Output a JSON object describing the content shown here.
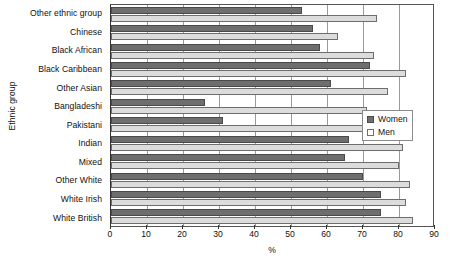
{
  "chart_data": {
    "type": "bar",
    "orientation": "horizontal",
    "title": "",
    "xlabel": "%",
    "ylabel": "Ethnic group",
    "xlim": [
      0,
      90
    ],
    "xticks": [
      0,
      10,
      20,
      30,
      40,
      50,
      60,
      70,
      80,
      90
    ],
    "grid": true,
    "legend_position": "right",
    "categories": [
      "Other ethnic group",
      "Chinese",
      "Black African",
      "Black Caribbean",
      "Other Asian",
      "Bangladeshi",
      "Pakistani",
      "Indian",
      "Mixed",
      "Other White",
      "White Irish",
      "White British"
    ],
    "series": [
      {
        "name": "Women",
        "color": "#6e6e6e",
        "values": [
          53,
          56,
          58,
          72,
          61,
          26,
          31,
          66,
          65,
          70,
          75,
          75
        ]
      },
      {
        "name": "Men",
        "color": "#dcdcdc",
        "values": [
          74,
          63,
          73,
          82,
          77,
          71,
          72,
          81,
          80,
          83,
          82,
          84
        ]
      }
    ]
  },
  "legend": {
    "items": [
      {
        "label": "Women"
      },
      {
        "label": "Men"
      }
    ]
  }
}
